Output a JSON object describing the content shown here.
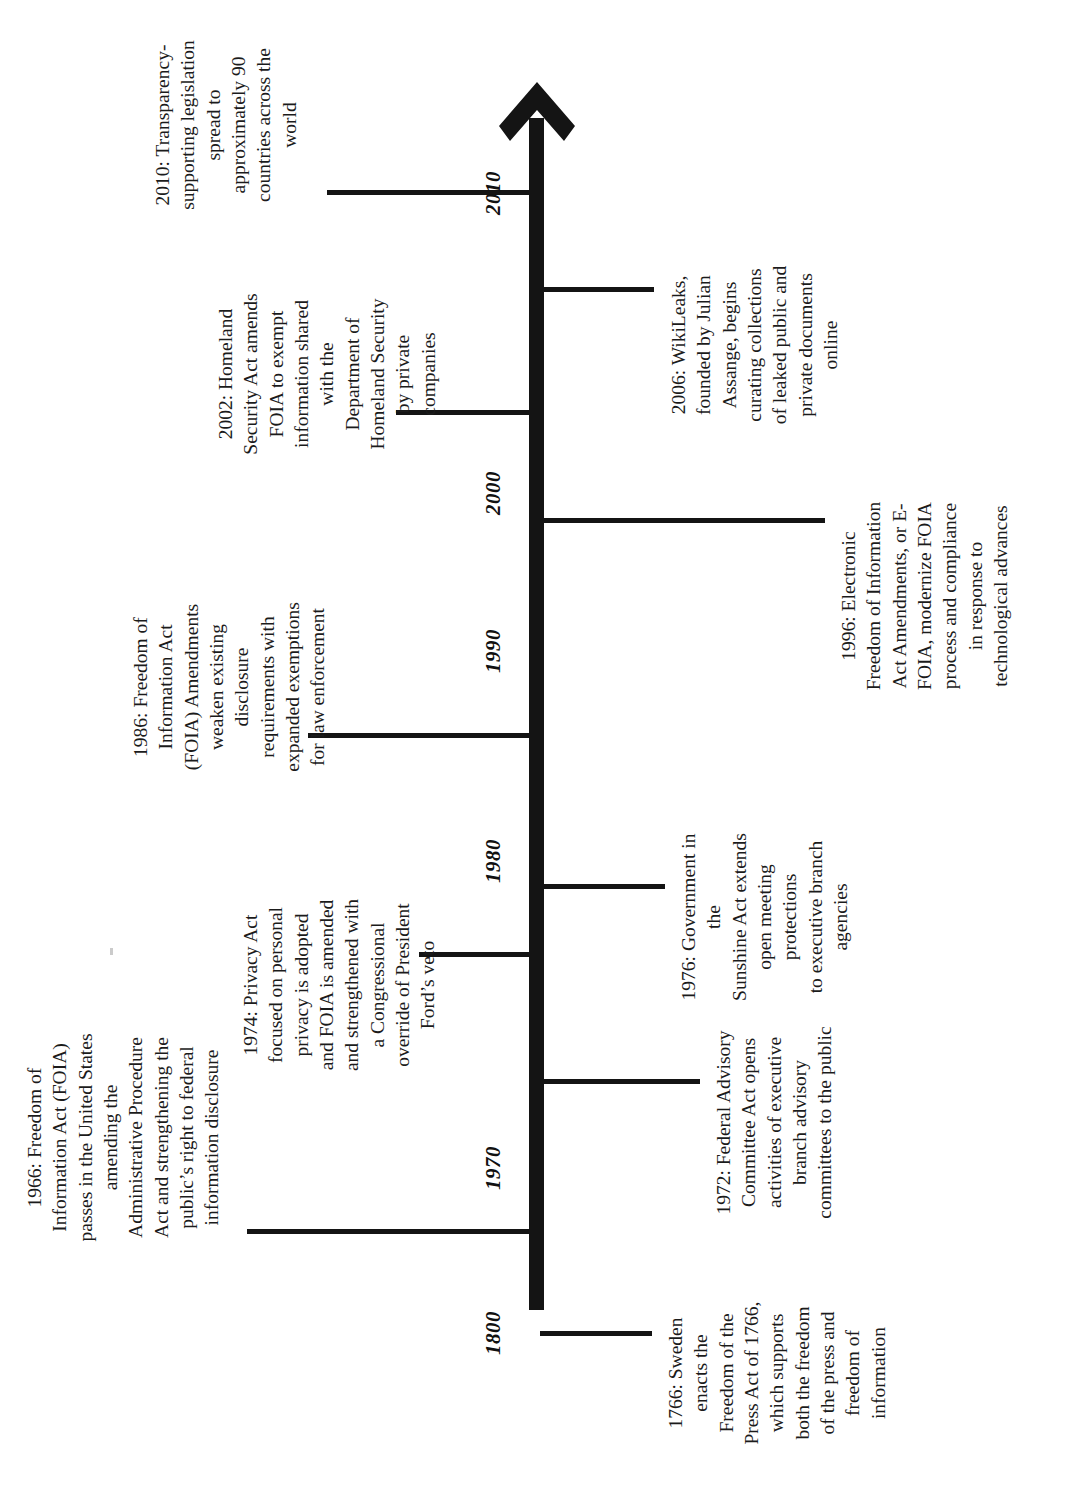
{
  "document": {
    "title": "Freedom of Information Act (FOIA) Timeline",
    "orientation": "rotated-90-counterclockwise",
    "background_color": "#ffffff",
    "ink_color": "#141414"
  },
  "axis": {
    "name": "timeline-axis",
    "direction": "arrow points toward later dates",
    "tick_labels": [
      {
        "id": "tick-1800",
        "label": "1800"
      },
      {
        "id": "tick-1970",
        "label": "1970"
      },
      {
        "id": "tick-1980",
        "label": "1980"
      },
      {
        "id": "tick-1990",
        "label": "1990"
      },
      {
        "id": "tick-2000",
        "label": "2000"
      },
      {
        "id": "tick-2010",
        "label": "2010"
      }
    ]
  },
  "events": [
    {
      "id": "event-1766",
      "year": "1766",
      "side": "right",
      "lines": [
        "1766: Sweden",
        "enacts the",
        "Freedom of the",
        "Press Act of 1766,",
        "which supports",
        "both the freedom",
        "of the press and",
        "freedom of",
        "information"
      ]
    },
    {
      "id": "event-1966",
      "year": "1966",
      "side": "left",
      "lines": [
        "1966: Freedom of",
        "Information Act (FOIA)",
        "passes in the United States",
        "amending the",
        "Administrative Procedure",
        "Act and strengthening the",
        "public’s right to federal",
        "information disclosure"
      ]
    },
    {
      "id": "event-1972",
      "year": "1972",
      "side": "right",
      "lines": [
        "1972: Federal Advisory",
        "Committee Act opens",
        "activities of executive",
        "branch advisory",
        "committees to the public"
      ]
    },
    {
      "id": "event-1974",
      "year": "1974",
      "side": "left",
      "lines": [
        "1974: Privacy Act",
        "focused on personal",
        "privacy is adopted",
        "and FOIA is amended",
        "and strengthened with",
        "a Congressional",
        "override of President",
        "Ford’s veto"
      ]
    },
    {
      "id": "event-1976",
      "year": "1976",
      "side": "right",
      "lines": [
        "1976: Government in the",
        "Sunshine Act extends",
        "open meeting protections",
        "to executive branch",
        "agencies"
      ]
    },
    {
      "id": "event-1986",
      "year": "1986",
      "side": "left",
      "lines": [
        "1986: Freedom of",
        "Information Act",
        "(FOIA) Amendments",
        "weaken existing",
        "disclosure",
        "requirements with",
        "expanded exemptions",
        "for law enforcement"
      ]
    },
    {
      "id": "event-1996",
      "year": "1996",
      "side": "right",
      "lines": [
        "1996: Electronic",
        "Freedom of Information",
        "Act Amendments, or E-",
        "FOIA, modernize FOIA",
        "process and compliance",
        "in response to",
        "technological advances"
      ]
    },
    {
      "id": "event-2002",
      "year": "2002",
      "side": "left",
      "lines": [
        "2002: Homeland",
        "Security Act amends",
        "FOIA to exempt",
        "information shared",
        "with the",
        "Department of",
        "Homeland Security",
        "by private",
        "companies"
      ]
    },
    {
      "id": "event-2006",
      "year": "2006",
      "side": "right",
      "lines": [
        "2006: WikiLeaks,",
        "founded by Julian",
        "Assange, begins",
        "curating collections",
        "of leaked public and",
        "private documents",
        "online"
      ]
    },
    {
      "id": "event-2010",
      "year": "2010",
      "side": "left",
      "lines": [
        "2010: Transparency-",
        "supporting legislation",
        "spread to",
        "approximately 90",
        "countries across the",
        "world"
      ]
    }
  ]
}
